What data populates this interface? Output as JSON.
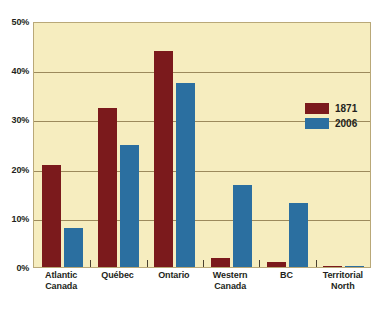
{
  "chart_data": {
    "type": "bar",
    "title": "",
    "subtitle": "",
    "xlabel": "",
    "ylabel": "",
    "ylim": [
      0,
      50
    ],
    "y_ticks": [
      "0%",
      "10%",
      "20%",
      "30%",
      "40%",
      "50%"
    ],
    "y_tick_values": [
      0,
      10,
      20,
      30,
      40,
      50
    ],
    "grid": true,
    "legend_position": "inside-top-right",
    "categories": [
      "Atlantic Canada",
      "Québec",
      "Ontario",
      "Western Canada",
      "BC",
      "Territorial North"
    ],
    "series": [
      {
        "name": "1871",
        "color": "#7b1a1c",
        "values": [
          20.8,
          32.3,
          44.0,
          1.9,
          1.1,
          0.2
        ]
      },
      {
        "name": "2006",
        "color": "#2b6fa0",
        "values": [
          8.0,
          24.9,
          37.4,
          16.7,
          13.0,
          0.3
        ]
      }
    ]
  },
  "legend": {
    "items": [
      {
        "label": "1871"
      },
      {
        "label": "2006"
      }
    ]
  },
  "colors": {
    "series_1871": "#7b1a1c",
    "series_2006": "#2b6fa0",
    "plot_background": "#f6edbf",
    "gridline": "#9c8a5c",
    "plot_border": "#b9a878",
    "text": "#231f20",
    "page_background": "#ffffff"
  }
}
